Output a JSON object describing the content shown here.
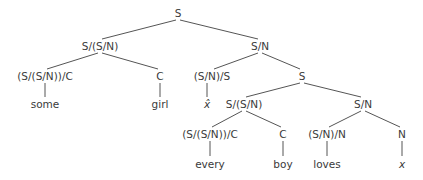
{
  "diagram": {
    "type": "categorial-grammar-derivation-tree",
    "line_color": "#555555",
    "text_color": "#3a3a3a",
    "nodes": [
      {
        "id": "n0",
        "label": "S",
        "x": 178,
        "y": 13,
        "parent": null
      },
      {
        "id": "n1",
        "label": "S/(S/N)",
        "x": 100,
        "y": 46,
        "parent": "n0"
      },
      {
        "id": "n2",
        "label": "S/N",
        "x": 260,
        "y": 46,
        "parent": "n0"
      },
      {
        "id": "n3",
        "label": "(S/(S/N))/C",
        "x": 45,
        "y": 76,
        "parent": "n1"
      },
      {
        "id": "n4",
        "label": "C",
        "x": 160,
        "y": 76,
        "parent": "n1"
      },
      {
        "id": "n5",
        "label": "(S/N)/S",
        "x": 212,
        "y": 76,
        "parent": "n2"
      },
      {
        "id": "n6",
        "label": "S",
        "x": 302,
        "y": 76,
        "parent": "n2"
      },
      {
        "id": "n7",
        "label": "some",
        "x": 45,
        "y": 104,
        "parent": "n3"
      },
      {
        "id": "n8",
        "label": "girl",
        "x": 160,
        "y": 104,
        "parent": "n4"
      },
      {
        "id": "n9",
        "label": "x̂",
        "x": 207,
        "y": 104,
        "parent": "n5",
        "italic": true
      },
      {
        "id": "n10",
        "label": "S/(S/N)",
        "x": 244,
        "y": 104,
        "parent": "n6"
      },
      {
        "id": "n11",
        "label": "S/N",
        "x": 363,
        "y": 104,
        "parent": "n6"
      },
      {
        "id": "n12",
        "label": "(S/(S/N))/C",
        "x": 210,
        "y": 134,
        "parent": "n10"
      },
      {
        "id": "n13",
        "label": "C",
        "x": 283,
        "y": 134,
        "parent": "n10"
      },
      {
        "id": "n14",
        "label": "(S/N)/N",
        "x": 327,
        "y": 134,
        "parent": "n11"
      },
      {
        "id": "n15",
        "label": "N",
        "x": 402,
        "y": 134,
        "parent": "n11"
      },
      {
        "id": "n16",
        "label": "every",
        "x": 210,
        "y": 164,
        "parent": "n12"
      },
      {
        "id": "n17",
        "label": "boy",
        "x": 283,
        "y": 164,
        "parent": "n13"
      },
      {
        "id": "n18",
        "label": "loves",
        "x": 327,
        "y": 164,
        "parent": "n14"
      },
      {
        "id": "n19",
        "label": "x",
        "x": 402,
        "y": 164,
        "parent": "n15",
        "italic": true
      }
    ]
  }
}
